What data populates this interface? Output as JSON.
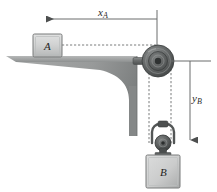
{
  "figure": {
    "background_color": "#ffffff"
  },
  "labels": {
    "x_a": {
      "text": "x",
      "subscript": "A"
    },
    "y_b": {
      "text": "y",
      "subscript": "B"
    },
    "block_a": "A",
    "block_b": "B"
  },
  "colors": {
    "block_fill_light": "#d5d6d6",
    "block_fill_dark": "#a9abab",
    "block_stroke": "#6e7070",
    "bracket_fill": "#9d9f9f",
    "bracket_fill_dark": "#7e8181",
    "pulley_dark": "#4c4e4e",
    "pulley_mid": "#6f7273",
    "pulley_light": "#9fa2a2",
    "dimension_line": "#6a6c6c",
    "cord_dashed": "#7b7d7d",
    "text": "#2b2b2b"
  },
  "geometry": {
    "canvas": {
      "width": 217,
      "height": 192
    },
    "dimension_x_a": {
      "line_y": 19,
      "x_start": 38,
      "x_end": 157,
      "arrow_direction": "left",
      "extension_line_x": 157,
      "extension_y_top": 10,
      "extension_y_bottom": 61
    },
    "dimension_y_b": {
      "line_x": 190,
      "y_start": 61,
      "y_end": 146,
      "arrow_direction": "down",
      "extension_line_y": 61,
      "extension_x_left": 168,
      "extension_x_right": 211
    },
    "shelf": {
      "top_y": 56,
      "left_x": 6,
      "right_x": 137,
      "thickness": 6
    },
    "bracket_vertical": {
      "left_x": 129,
      "right_x": 137,
      "top_y": 56,
      "bottom_y": 136
    },
    "block_a": {
      "x": 33,
      "y": 34,
      "width": 29,
      "height": 23
    },
    "block_b": {
      "x": 146,
      "y": 155,
      "width": 34,
      "height": 33
    },
    "pulley_main": {
      "cx": 158,
      "cy": 61,
      "r_outer": 16
    },
    "pulley_small": {
      "cx": 163,
      "cy": 143,
      "r_outer": 8
    },
    "axle": {
      "x": 134,
      "y": 58,
      "width": 24,
      "height": 7
    },
    "cord_horizontal": {
      "y": 45,
      "x_start": 62,
      "x_end": 158
    },
    "cord_left_vertical": {
      "x": 149,
      "y_start": 61,
      "y_end": 143
    },
    "cord_right_vertical": {
      "x": 171,
      "y_start": 61,
      "y_end": 143
    }
  }
}
